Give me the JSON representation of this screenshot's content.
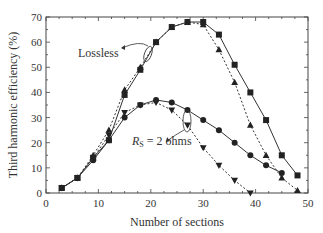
{
  "chart_data": {
    "type": "line",
    "title": "",
    "xlabel": "Number of sections",
    "ylabel": "Third harmonic efficiency (%)",
    "xlim": [
      0,
      50
    ],
    "ylim": [
      0,
      70
    ],
    "xticks": [
      0,
      10,
      20,
      30,
      40,
      50
    ],
    "yticks": [
      0,
      10,
      20,
      30,
      40,
      50,
      60,
      70
    ],
    "grid": false,
    "legend": null,
    "annotations": [
      {
        "text": "Lossless",
        "points_to": "upper curves near x=12-15"
      },
      {
        "text": "R_S = 2 ohms",
        "points_to": "lower curves near x=27"
      }
    ],
    "series": [
      {
        "name": "Lossless (squares, solid)",
        "marker": "square",
        "line": "solid",
        "x": [
          3,
          6,
          9,
          12,
          15,
          18,
          21,
          24,
          27,
          30,
          33,
          36,
          39,
          42,
          45,
          48
        ],
        "y": [
          2,
          6,
          14,
          21,
          39,
          49,
          60,
          66,
          68,
          68,
          63,
          51,
          40,
          29,
          15,
          7
        ]
      },
      {
        "name": "Lossless (triangles, dotted)",
        "marker": "triangle-up",
        "line": "dotted",
        "x": [
          3,
          6,
          9,
          12,
          15,
          18,
          21,
          24,
          27,
          30,
          33,
          36,
          39,
          42,
          45,
          48
        ],
        "y": [
          2,
          6,
          15,
          25,
          41,
          50,
          60,
          66,
          68,
          67,
          57,
          44,
          27,
          15,
          6,
          1
        ]
      },
      {
        "name": "R_S = 2 ohms (circles, solid)",
        "marker": "circle",
        "line": "solid",
        "x": [
          3,
          6,
          9,
          12,
          15,
          18,
          21,
          24,
          27,
          30,
          33,
          36,
          39,
          42,
          45
        ],
        "y": [
          2,
          6,
          13,
          21,
          30,
          35,
          37,
          36,
          33,
          29,
          25,
          20,
          15,
          11,
          8
        ]
      },
      {
        "name": "R_S = 2 ohms (inverted triangles, dotted)",
        "marker": "triangle-down",
        "line": "dotted",
        "x": [
          3,
          6,
          9,
          12,
          15,
          18,
          21,
          24,
          27,
          30,
          33,
          36,
          39
        ],
        "y": [
          2,
          6,
          14,
          23,
          32,
          35,
          36,
          33,
          27,
          18,
          11,
          5,
          0
        ]
      }
    ]
  }
}
